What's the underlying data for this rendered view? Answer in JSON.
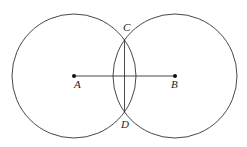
{
  "diagram": {
    "type": "geometric-construction",
    "colors": {
      "stroke": "#333333",
      "point": "#111111",
      "label": "#222222",
      "background": "#ffffff"
    },
    "points": {
      "A": {
        "label": "A",
        "x": 74,
        "y": 76
      },
      "B": {
        "label": "B",
        "x": 175,
        "y": 76
      },
      "C": {
        "label": "C",
        "x": 124.5,
        "y": 40
      },
      "D": {
        "label": "D",
        "x": 124.5,
        "y": 112
      }
    },
    "circles": [
      {
        "name": "circle-centered-A",
        "center": "A",
        "cx": 74,
        "cy": 76,
        "r": 62
      },
      {
        "name": "circle-centered-B",
        "center": "B",
        "cx": 175,
        "cy": 76,
        "r": 62
      }
    ],
    "segments": [
      {
        "name": "segment-AB",
        "from": "A",
        "to": "B"
      },
      {
        "name": "segment-CD",
        "from": "C",
        "to": "D"
      }
    ],
    "labels": {
      "A": {
        "text": "A",
        "x": 74,
        "y": 88
      },
      "B": {
        "text": "B",
        "x": 171,
        "y": 88
      },
      "C": {
        "text": "C",
        "x": 123,
        "y": 31
      },
      "D": {
        "text": "D",
        "x": 121,
        "y": 128
      }
    }
  }
}
